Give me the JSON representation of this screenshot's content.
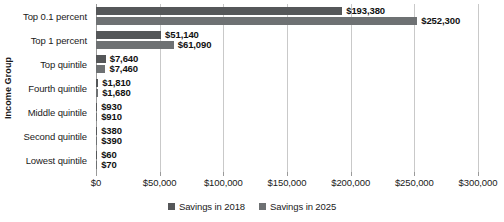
{
  "chart_data": {
    "type": "bar",
    "orientation": "horizontal",
    "title": "",
    "xlabel": "",
    "ylabel": "Income Group",
    "xlim": [
      0,
      300000
    ],
    "xticks": [
      0,
      50000,
      100000,
      150000,
      200000,
      250000,
      300000
    ],
    "xtick_labels": [
      "$0",
      "$50,000",
      "$100,000",
      "$150,000",
      "$200,000",
      "$250,000",
      "$300,000"
    ],
    "grid": true,
    "grid_axis": "x",
    "legend_position": "bottom",
    "categories": [
      "Top 0.1 percent",
      "Top 1 percent",
      "Top quintile",
      "Fourth quintile",
      "Middle quintile",
      "Second quintile",
      "Lowest quintile"
    ],
    "series": [
      {
        "name": "Savings in 2018",
        "color": "#555759",
        "values": [
          193380,
          51140,
          7640,
          1810,
          930,
          380,
          60
        ],
        "labels": [
          "$193,380",
          "$51,140",
          "$7,640",
          "$1,810",
          "$930",
          "$380",
          "$60"
        ]
      },
      {
        "name": "Savings in 2025",
        "color": "#6e7173",
        "values": [
          252300,
          61090,
          7460,
          1680,
          910,
          390,
          70
        ],
        "labels": [
          "$252,300",
          "$61,090",
          "$7,460",
          "$1,680",
          "$910",
          "$390",
          "$70"
        ]
      }
    ]
  },
  "legend": {
    "items": [
      {
        "label": "Savings in 2018"
      },
      {
        "label": "Savings in 2025"
      }
    ]
  },
  "colors": {
    "series_2018": "#555759",
    "series_2025": "#6e7173",
    "gridline": "#c9c9c9",
    "axis": "#9a9a9a",
    "text": "#1a1a1a",
    "background": "#ffffff"
  }
}
